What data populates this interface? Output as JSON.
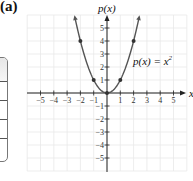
{
  "panel_label": "(a)",
  "chart_data": {
    "type": "line",
    "title": "",
    "function_label": "p(x) = x²",
    "function_label_parts": {
      "lhs": "p(x) = x",
      "exp": "2"
    },
    "xlabel": "x",
    "ylabel": "p(x)",
    "xlim": [
      -5,
      5
    ],
    "ylim": [
      -5,
      5
    ],
    "grid": true,
    "x_ticks": [
      -5,
      -4,
      -3,
      -2,
      -1,
      1,
      2,
      3,
      4,
      5
    ],
    "y_ticks": [
      -5,
      -4,
      -3,
      -2,
      -1,
      1,
      2,
      3,
      4,
      5
    ],
    "x_tick_labels": [
      "−5",
      "−4",
      "−3",
      "−2",
      "−1",
      "1",
      "2",
      "3",
      "4",
      "5"
    ],
    "y_tick_labels": [
      "−5",
      "−4",
      "−3",
      "−2",
      "−1",
      "1",
      "2",
      "3",
      "4",
      "5"
    ],
    "series": [
      {
        "name": "p(x) = x^2",
        "curve_domain": [
          -2.4,
          2.4
        ],
        "points": [
          {
            "x": -2,
            "y": 4
          },
          {
            "x": -1,
            "y": 1
          },
          {
            "x": 0,
            "y": 0
          },
          {
            "x": 1,
            "y": 1
          },
          {
            "x": 2,
            "y": 4
          }
        ]
      }
    ],
    "colors": {
      "curve": "#555555",
      "axis": "#222222",
      "grid": "#e8e8e8"
    }
  },
  "table_stub": {
    "rows": 4
  }
}
